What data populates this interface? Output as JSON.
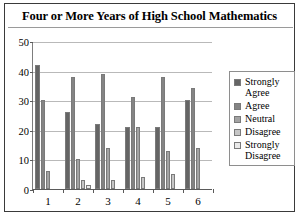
{
  "chart_data": {
    "type": "bar",
    "title": "Four or More Years of High School Mathematics",
    "xlabel": "",
    "ylabel": "",
    "ylim": [
      0,
      50
    ],
    "yticks": [
      0,
      10,
      20,
      30,
      40,
      50
    ],
    "grid": true,
    "legend_position": "right",
    "categories": [
      "1",
      "2",
      "3",
      "4",
      "5",
      "6"
    ],
    "series": [
      {
        "name": "Strongly Agree",
        "color": "#656565",
        "values": [
          42,
          26,
          22,
          21,
          21,
          30
        ]
      },
      {
        "name": "Agree",
        "color": "#848484",
        "values": [
          30,
          38,
          39,
          31,
          38,
          34
        ]
      },
      {
        "name": "Neutral",
        "color": "#a3a3a3",
        "values": [
          6,
          10,
          14,
          21,
          13,
          14
        ]
      },
      {
        "name": "Disagree",
        "color": "#c6c6c6",
        "values": [
          0,
          3,
          3,
          4,
          5,
          0
        ]
      },
      {
        "name": "Strongly Disagree",
        "color": "#eaeaea",
        "values": [
          0,
          1.5,
          0,
          0,
          0,
          0
        ]
      }
    ]
  }
}
